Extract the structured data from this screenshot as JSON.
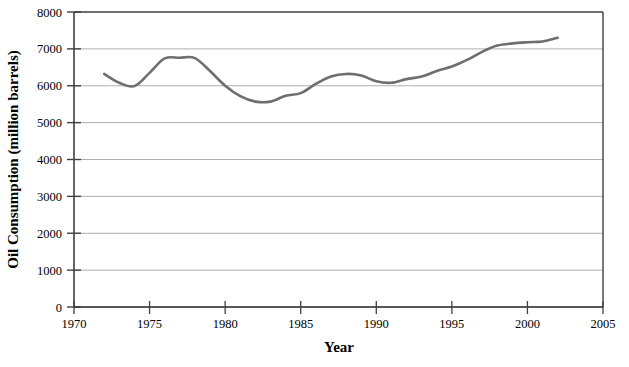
{
  "chart_data": {
    "type": "line",
    "title": "",
    "xlabel": "Year",
    "ylabel": "Oil Consumption (million barrels)",
    "xlim": [
      1970,
      2005
    ],
    "ylim": [
      0,
      8000
    ],
    "xticks": [
      1970,
      1975,
      1980,
      1985,
      1990,
      1995,
      2000,
      2005
    ],
    "yticks": [
      0,
      1000,
      2000,
      3000,
      4000,
      5000,
      6000,
      7000,
      8000
    ],
    "grid": "horizontal",
    "legend": "none",
    "series": [
      {
        "name": "Oil Consumption",
        "color": "#6e6e6e",
        "x": [
          1972,
          1973,
          1974,
          1975,
          1976,
          1977,
          1978,
          1979,
          1980,
          1981,
          1982,
          1983,
          1984,
          1985,
          1986,
          1987,
          1988,
          1989,
          1990,
          1991,
          1992,
          1993,
          1994,
          1995,
          1996,
          1997,
          1998,
          1999,
          2000,
          2001,
          2002
        ],
        "values": [
          6320,
          6080,
          5990,
          6350,
          6740,
          6760,
          6750,
          6400,
          6000,
          5720,
          5570,
          5570,
          5730,
          5800,
          6050,
          6250,
          6320,
          6280,
          6120,
          6080,
          6180,
          6250,
          6400,
          6520,
          6700,
          6920,
          7090,
          7150,
          7180,
          7200,
          7300
        ]
      }
    ]
  },
  "axes": {
    "y_title": "Oil Consumption (million barrels)",
    "x_title": "Year",
    "y_tick_labels": [
      "8000",
      "7000",
      "6000",
      "5000",
      "4000",
      "3000",
      "2000",
      "1000",
      "0"
    ],
    "x_tick_labels": [
      "1970",
      "1975",
      "1980",
      "1985",
      "1990",
      "1995",
      "2000",
      "2005"
    ]
  },
  "colors": {
    "line": "#6e6e6e",
    "grid": "#9a9a9a",
    "axis": "#404040",
    "text": "#000000",
    "background": "#ffffff"
  }
}
